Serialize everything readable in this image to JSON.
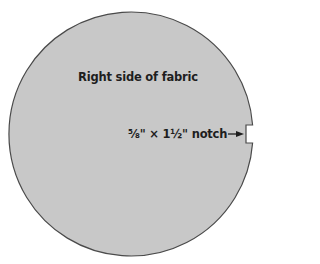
{
  "diagram": {
    "shape": "circle",
    "fill_color": "#c8c8c8",
    "stroke_color": "#4a4a4a",
    "background": "#ffffff",
    "labels": {
      "face": "Right side of fabric",
      "notch": "⅝\" × 1½\" notch"
    },
    "notch": {
      "width_in": "⅝\"",
      "length_in": "1½\"",
      "position": "right edge"
    }
  }
}
